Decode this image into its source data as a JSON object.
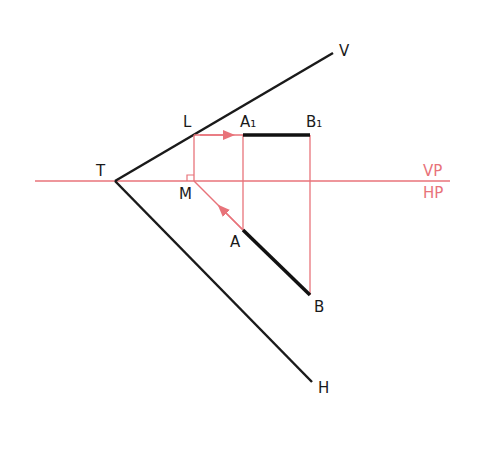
{
  "diagram": {
    "colors": {
      "ink": "#1a1a1a",
      "construction": "#e8737a"
    },
    "labels": {
      "T": "T",
      "V": "V",
      "H": "H",
      "L": "L",
      "M": "M",
      "A1": "A₁",
      "B1": "B₁",
      "A": "A",
      "B": "B",
      "VP": "VP",
      "HP": "HP"
    },
    "points": {
      "T": [
        115,
        181
      ],
      "V_end": [
        333,
        53
      ],
      "H_end": [
        312,
        382
      ],
      "L": [
        194,
        135
      ],
      "M": [
        194,
        181
      ],
      "A1": [
        243,
        135
      ],
      "B1": [
        310,
        135
      ],
      "A": [
        243,
        230
      ],
      "B": [
        310,
        295
      ]
    }
  }
}
